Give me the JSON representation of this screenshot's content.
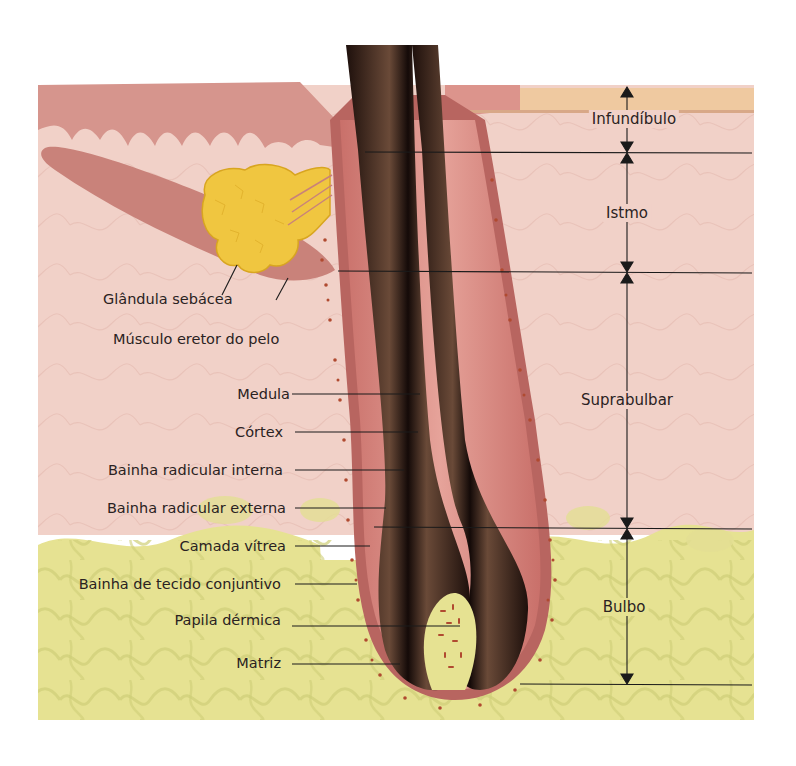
{
  "colors": {
    "background": "#ffffff",
    "dermis_pink": "#f1d1c8",
    "epidermis_rose": "#d99a92",
    "stratum_corneum": "#efc9a0",
    "fat_yellow": "#e6e292",
    "fat_outline": "#c8c86a",
    "sebaceous_gland": "#f0c640",
    "hair_shaft_dark": "#2b1712",
    "hair_shaft_mid": "#5a3a2a",
    "follicle_sheath": "#d98c86",
    "sheath_dots": "#b04a30",
    "label_line": "#1a1a1a"
  },
  "left_labels": [
    {
      "id": "glandula-sebacea",
      "text": "Glândula sebácea"
    },
    {
      "id": "musculo-eretor",
      "text": "Músculo eretor do pelo"
    },
    {
      "id": "medula",
      "text": "Medula"
    },
    {
      "id": "cortex",
      "text": "Córtex"
    },
    {
      "id": "bainha-radicular-interna",
      "text": "Bainha radicular interna"
    },
    {
      "id": "bainha-radicular-externa",
      "text": "Bainha radicular externa"
    },
    {
      "id": "camada-vitrea",
      "text": "Camada vítrea"
    },
    {
      "id": "bainha-tecido-conjuntivo",
      "text": "Bainha de tecido conjuntivo"
    },
    {
      "id": "papila-dermica",
      "text": "Papila dérmica"
    },
    {
      "id": "matriz",
      "text": "Matriz"
    }
  ],
  "zones": [
    {
      "id": "infundibulo",
      "text": "Infundíbulo"
    },
    {
      "id": "istmo",
      "text": "Istmo"
    },
    {
      "id": "suprabulbar",
      "text": "Suprabulbar"
    },
    {
      "id": "bulbo",
      "text": "Bulbo"
    }
  ]
}
